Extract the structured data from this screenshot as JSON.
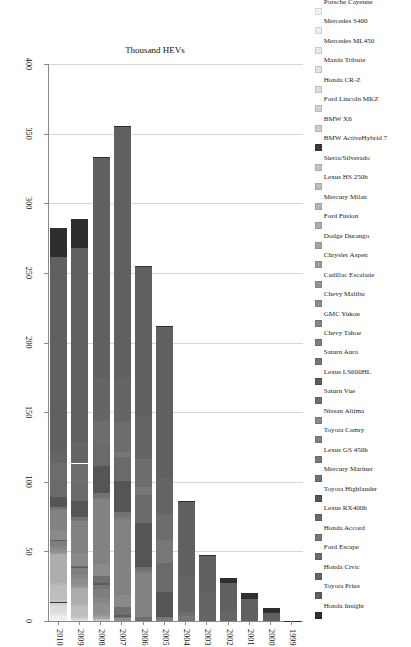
{
  "chart_data": {
    "type": "bar",
    "subtype": "stacked-horizontal",
    "title": "",
    "xlabel": "",
    "ylabel": "Thousand HEVs",
    "orientation": "horizontal",
    "grid": true,
    "legend_position": "top",
    "value_axis": {
      "label": "Thousand HEVs",
      "ticks": [
        0,
        50,
        100,
        150,
        200,
        250,
        300,
        350,
        400
      ],
      "lim": [
        0,
        400
      ],
      "reversed": true
    },
    "categories": [
      "1999",
      "2000",
      "2001",
      "2002",
      "2003",
      "2004",
      "2005",
      "2006",
      "2007",
      "2008",
      "2009",
      "2010"
    ],
    "totals": [
      0.3,
      9.4,
      20.3,
      35.0,
      47.6,
      84.2,
      209.7,
      252.6,
      352.3,
      312.4,
      290.3,
      274.2
    ],
    "series": [
      {
        "name": "Porsche Cayenne",
        "color": "#f2f2f2",
        "values": [
          0,
          0,
          0,
          0,
          0,
          0,
          0,
          0,
          0,
          0,
          0,
          1.2
        ]
      },
      {
        "name": "Mercedes S400",
        "color": "#eeeeee",
        "values": [
          0,
          0,
          0,
          0,
          0,
          0,
          0,
          0,
          0,
          0,
          0,
          2.1
        ]
      },
      {
        "name": "Mercedes ML450",
        "color": "#e8e8e8",
        "values": [
          0,
          0,
          0,
          0,
          0,
          0,
          0,
          0,
          0,
          0,
          0,
          1.4
        ]
      },
      {
        "name": "Mazda Tribute",
        "color": "#e2e2e2",
        "values": [
          0,
          0,
          0,
          0,
          0,
          0,
          0,
          0,
          0,
          0,
          0.6,
          1.0
        ]
      },
      {
        "name": "Honda CR-Z",
        "color": "#dcdcdc",
        "values": [
          0,
          0,
          0,
          0,
          0,
          0,
          0,
          0,
          0,
          0,
          0,
          5.2
        ]
      },
      {
        "name": "Ford Lincoln MKZ",
        "color": "#d4d4d4",
        "values": [
          0,
          0,
          0,
          0,
          0,
          0,
          0,
          0,
          0,
          0,
          1.2,
          1.7
        ]
      },
      {
        "name": "BMW X6",
        "color": "#cccccc",
        "values": [
          0,
          0,
          0,
          0,
          0,
          0,
          0,
          0,
          0,
          0,
          0,
          0.5
        ]
      },
      {
        "name": "BMW ActiveHybrid 7",
        "color": "#3a3a3a",
        "values": [
          0,
          0,
          0,
          0,
          0,
          0,
          0,
          0,
          0,
          0,
          0,
          0.4
        ]
      },
      {
        "name": "Sierra/Silverado",
        "color": "#c4c4c4",
        "values": [
          0,
          0,
          0,
          0,
          0,
          0,
          0,
          0,
          0,
          1.1,
          2.1,
          1.9
        ]
      },
      {
        "name": "Lexus HS 250h",
        "color": "#bdbdbd",
        "values": [
          0,
          0,
          0,
          0,
          0,
          0,
          0,
          0,
          0,
          0,
          6.7,
          10.7
        ]
      },
      {
        "name": "Mercury Milan",
        "color": "#b5b5b5",
        "values": [
          0,
          0,
          0,
          0,
          0,
          0,
          0,
          0,
          0,
          0,
          1.7,
          1.5
        ]
      },
      {
        "name": "Ford Fusion",
        "color": "#adadad",
        "values": [
          0,
          0,
          0,
          0,
          0,
          0,
          0,
          0,
          0,
          0,
          11.3,
          20.8
        ]
      },
      {
        "name": "Dodge Durango",
        "color": "#a5a5a5",
        "values": [
          0,
          0,
          0,
          0,
          0,
          0,
          0,
          0,
          0,
          1.6,
          0.4,
          0
        ]
      },
      {
        "name": "Chrysler Aspen",
        "color": "#9d9d9d",
        "values": [
          0,
          0,
          0,
          0,
          0,
          0,
          0,
          0,
          0,
          0.8,
          0.2,
          0
        ]
      },
      {
        "name": "Cadillac Escalade",
        "color": "#959595",
        "values": [
          0,
          0,
          0,
          0,
          0,
          0,
          0,
          0,
          0,
          1.2,
          1.6,
          1.1
        ]
      },
      {
        "name": "Chevy Malibu",
        "color": "#8e8e8e",
        "values": [
          0,
          0,
          0,
          0,
          0,
          0,
          0,
          0,
          2.2,
          8.2,
          4.4,
          1.9
        ]
      },
      {
        "name": "GMC Yukon",
        "color": "#868686",
        "values": [
          0,
          0,
          0,
          0,
          0,
          0,
          0,
          0,
          0,
          3.5,
          2.8,
          2.5
        ]
      },
      {
        "name": "Chevy Tahoe",
        "color": "#7e7e7e",
        "values": [
          0,
          0,
          0,
          0,
          0,
          0,
          0,
          0,
          0,
          6.5,
          4.9,
          3.6
        ]
      },
      {
        "name": "Saturn Aura",
        "color": "#767676",
        "values": [
          0,
          0,
          0,
          0,
          0,
          0,
          0,
          0,
          0.8,
          3.1,
          0.6,
          0
        ]
      },
      {
        "name": "Lexus LS600HL",
        "color": "#5c5c5c",
        "values": [
          0,
          0,
          0,
          0,
          0,
          0,
          0,
          0,
          1.0,
          1.0,
          0.5,
          0.4
        ]
      },
      {
        "name": "Saturn Vue",
        "color": "#6f6f6f",
        "values": [
          0,
          0,
          0,
          0,
          0,
          0,
          0,
          2.9,
          6.4,
          5.2,
          0.6,
          0
        ]
      },
      {
        "name": "Nissan Altima",
        "color": "#8a8a8a",
        "values": [
          0,
          0,
          0,
          0,
          0,
          0,
          0,
          0,
          8.4,
          8.8,
          9.4,
          7.2
        ]
      },
      {
        "name": "Toyota Camry",
        "color": "#828282",
        "values": [
          0,
          0,
          0,
          0,
          0,
          0,
          0,
          31.3,
          54.5,
          46.3,
          22.9,
          14.6
        ]
      },
      {
        "name": "Lexus GS 450h",
        "color": "#7a7a7a",
        "values": [
          0,
          0,
          0,
          0,
          0,
          0,
          1.8,
          1.6,
          1.6,
          1.1,
          0.6,
          0.4
        ]
      },
      {
        "name": "Mercury Mariner",
        "color": "#727272",
        "values": [
          0,
          0,
          0,
          0,
          0,
          1.0,
          1.0,
          3.2,
          3.6,
          3.5,
          2.4,
          1.5
        ]
      },
      {
        "name": "Toyota Highlander",
        "color": "#555555",
        "values": [
          0,
          0,
          0,
          0,
          0,
          0,
          17.9,
          31.5,
          22.1,
          19.1,
          11.0,
          7.2
        ]
      },
      {
        "name": "Lexus RX400h",
        "color": "#6a6a6a",
        "values": [
          0,
          0,
          0,
          0,
          0,
          0,
          20.7,
          20.2,
          17.3,
          15.2,
          12.3,
          13.4
        ]
      },
      {
        "name": "Honda Accord",
        "color": "#777777",
        "values": [
          0,
          0,
          0,
          0,
          0,
          2.5,
          16.8,
          5.6,
          3.4,
          0,
          0,
          0
        ]
      },
      {
        "name": "Ford Escape",
        "color": "#6d6d6d",
        "values": [
          0,
          0,
          0,
          0,
          0,
          2.9,
          18.8,
          20.1,
          21.4,
          17.2,
          14.9,
          11.2
        ]
      },
      {
        "name": "Honda Civic",
        "color": "#656565",
        "values": [
          0,
          0,
          0,
          7.2,
          21.8,
          25.6,
          25.9,
          31.3,
          31.3,
          31.3,
          15.1,
          7.3
        ]
      },
      {
        "name": "Toyota Prius",
        "color": "#606060",
        "values": [
          0,
          5.6,
          15.6,
          20.1,
          24.6,
          53.9,
          107.9,
          106.9,
          181.2,
          158.6,
          139.7,
          140.9
        ]
      },
      {
        "name": "Honda Insight",
        "color": "#2e2e2e",
        "values": [
          0.3,
          3.8,
          4.7,
          3.5,
          1.2,
          0.6,
          0.7,
          0.2,
          0.1,
          0.1,
          20.6,
          20.6
        ]
      }
    ]
  }
}
